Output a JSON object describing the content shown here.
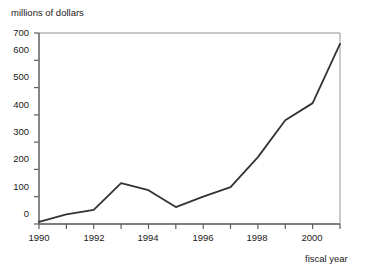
{
  "chart_data": {
    "type": "line",
    "title": "",
    "subtitle": "",
    "xlabel": "fiscal year",
    "ylabel": "millions of dollars",
    "x": [
      1990,
      1991,
      1992,
      1993,
      1994,
      1995,
      1996,
      1997,
      1998,
      1999,
      2000,
      2001
    ],
    "values": [
      8,
      35,
      52,
      150,
      124,
      62,
      100,
      135,
      245,
      380,
      443,
      660
    ],
    "series": [
      {
        "name": "",
        "values": [
          8,
          35,
          52,
          150,
          124,
          62,
          100,
          135,
          245,
          380,
          443,
          660
        ]
      }
    ],
    "xlim": [
      1990,
      2001
    ],
    "ylim": [
      0,
      700
    ],
    "ytick_labels": [
      "0",
      "100",
      "200",
      "300",
      "400",
      "500",
      "600",
      "700"
    ],
    "ytick_values": [
      0,
      100,
      200,
      300,
      400,
      500,
      600,
      700
    ],
    "xtick_values": [
      1990,
      1991,
      1992,
      1993,
      1994,
      1995,
      1996,
      1997,
      1998,
      1999,
      2000,
      2001
    ],
    "xtick_labels": [
      "1990",
      "",
      "1992",
      "",
      "1994",
      "",
      "1996",
      "",
      "1998",
      "",
      "2000",
      ""
    ],
    "grid": false,
    "legend": null,
    "legend_position": "none",
    "annotations": [],
    "colors": {
      "line": "#333333",
      "axis": "#555555",
      "frame": "#b4b4b4",
      "text": "#1a1a1a",
      "background": "#ffffff"
    }
  }
}
